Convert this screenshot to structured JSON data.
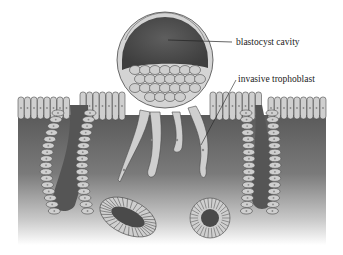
{
  "figure": {
    "labels": {
      "blastocyst_cavity": "blastocyst cavity",
      "invasive_trophoblast": "invasive trophoblast"
    },
    "colors": {
      "background": "#ffffff",
      "tissue_dark": "#5a5a5a",
      "tissue_light": "#e8e8e8",
      "cell_fill": "#cfcfcf",
      "cell_stroke": "#4a4a4a",
      "cavity": "#555555",
      "label_text": "#222222"
    }
  }
}
